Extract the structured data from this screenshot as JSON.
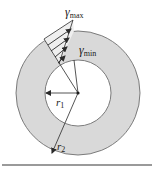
{
  "figure": {
    "type": "annular cross-section shear strain distribution",
    "colors": {
      "ring_fill": "#d9d9d9",
      "ring_stroke": "#6e6e6e",
      "line": "#2a2a2a",
      "bottom_rule": "#9a9a9a",
      "background": "#ffffff"
    },
    "labels": {
      "gamma_max": {
        "symbol": "γ",
        "subscript": "max"
      },
      "gamma_min": {
        "symbol": "γ",
        "subscript": "min"
      },
      "r1": {
        "symbol": "r",
        "subscript": "1"
      },
      "r2": {
        "symbol": "r",
        "subscript": "2"
      }
    },
    "geometry": {
      "center": [
        78,
        93
      ],
      "inner_radius": 33,
      "outer_radius": 62,
      "strain_arrows": 4
    }
  }
}
